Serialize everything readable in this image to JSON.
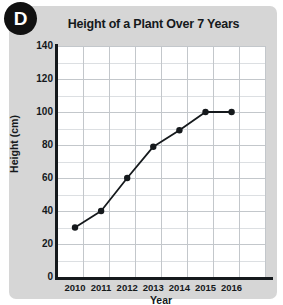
{
  "badge": {
    "letter": "D"
  },
  "chart_data": {
    "type": "line",
    "title": "Height of a Plant Over 7 Years",
    "xlabel": "Year",
    "ylabel": "Height (cm)",
    "categories": [
      "2010",
      "2011",
      "2012",
      "2013",
      "2014",
      "2015",
      "2016"
    ],
    "values": [
      30,
      40,
      60,
      79,
      89,
      100,
      100
    ],
    "series": [
      {
        "name": "Height of a Plant",
        "values": [
          30,
          40,
          60,
          79,
          89,
          100,
          100
        ]
      }
    ],
    "ylim": [
      0,
      140
    ],
    "y_major_ticks": [
      0,
      20,
      40,
      60,
      80,
      100,
      120,
      140
    ],
    "y_minor_step": 10,
    "y_tick_labels": [
      "0",
      "20",
      "40",
      "60",
      "80",
      "100",
      "120",
      "140"
    ],
    "x_tick_labels": [
      "2010",
      "2011",
      "2012",
      "2013",
      "2014",
      "2015",
      "2016"
    ],
    "grid": true,
    "legend": "none",
    "marker": "filled-circle",
    "line_color": "#15191c",
    "marker_color": "#15191c",
    "grid_color": "#c3c7cb",
    "plot_background": "#ffffff",
    "panel_background": "#d6d6d6"
  }
}
